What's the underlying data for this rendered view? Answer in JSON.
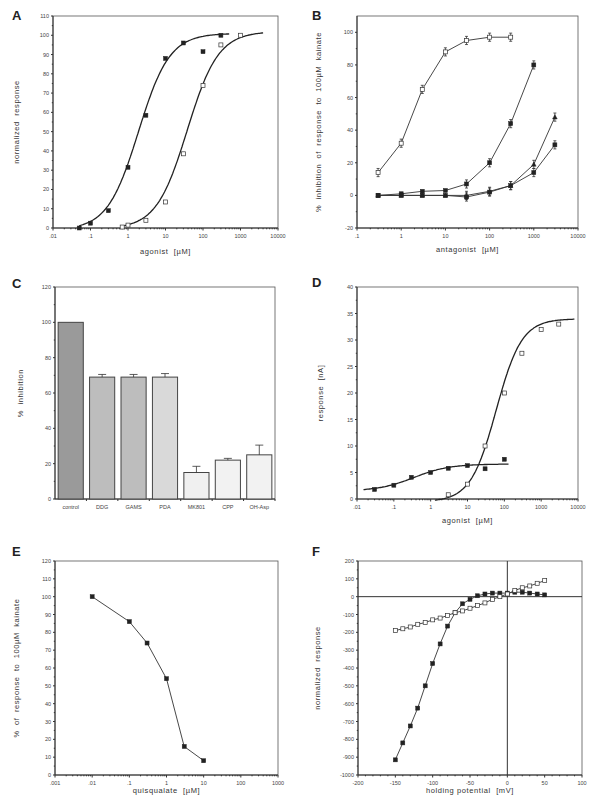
{
  "figure": {
    "panels": [
      "A",
      "B",
      "C",
      "D",
      "E",
      "F"
    ]
  },
  "chart_data": [
    {
      "panel": "A",
      "type": "line",
      "title": "",
      "xlabel": "agonist [µM]",
      "ylabel": "normalized response",
      "xscale": "log",
      "xlim": [
        0.01,
        10000
      ],
      "ylim": [
        0,
        110
      ],
      "xticks": [
        ".01",
        ".1",
        "1",
        "10",
        "100",
        "1000",
        "10000"
      ],
      "yticks": [
        "0",
        "10",
        "20",
        "30",
        "40",
        "50",
        "60",
        "70",
        "80",
        "90",
        "100",
        "110"
      ],
      "grid": false,
      "series": [
        {
          "name": "filled squares (fitted sigmoid)",
          "marker": "filled-square",
          "x": [
            0.05,
            0.1,
            0.3,
            1,
            3,
            10,
            30,
            100,
            300
          ],
          "y": [
            0,
            2.5,
            9,
            31.5,
            58.5,
            88,
            96,
            91.5,
            100
          ]
        },
        {
          "name": "open squares (fitted sigmoid)",
          "marker": "open-square",
          "x": [
            0.7,
            1,
            3,
            10,
            30,
            100,
            300,
            1000
          ],
          "y": [
            0.5,
            1.5,
            4,
            13.5,
            38.5,
            74,
            95,
            100
          ]
        }
      ]
    },
    {
      "panel": "B",
      "type": "line",
      "xlabel": "antagonist [µM]",
      "ylabel": "% inhibition of response to 100µM kainate",
      "xscale": "log",
      "xlim": [
        0.1,
        10000
      ],
      "ylim": [
        -20,
        110
      ],
      "xticks": [
        ".1",
        "1",
        "10",
        "100",
        "1000",
        "10000"
      ],
      "yticks": [
        "-20",
        "0",
        "20",
        "40",
        "60",
        "80",
        "100"
      ],
      "grid": false,
      "series": [
        {
          "name": "open squares",
          "marker": "open-square",
          "x": [
            0.3,
            1,
            3,
            10,
            30,
            100,
            300
          ],
          "y": [
            14,
            32,
            65,
            88,
            95,
            97,
            97
          ]
        },
        {
          "name": "filled squares (steep)",
          "marker": "filled-square",
          "x": [
            0.3,
            1,
            3,
            10,
            30,
            100,
            300,
            1000
          ],
          "y": [
            0,
            1,
            2.5,
            3,
            7,
            20,
            44,
            80
          ]
        },
        {
          "name": "triangles",
          "marker": "filled-triangle",
          "x": [
            0.3,
            1,
            3,
            10,
            30,
            100,
            300,
            1000,
            3000
          ],
          "y": [
            0,
            0,
            0,
            0,
            0,
            2.5,
            6,
            19,
            48
          ]
        },
        {
          "name": "filled squares (shallow)",
          "marker": "filled-square",
          "x": [
            0.3,
            1,
            3,
            10,
            30,
            100,
            300,
            1000,
            3000
          ],
          "y": [
            0,
            0,
            0,
            0,
            -1,
            2,
            6,
            14,
            31
          ]
        }
      ]
    },
    {
      "panel": "C",
      "type": "bar",
      "xlabel": "",
      "ylabel": "% inhibition",
      "ylim": [
        0,
        120
      ],
      "yticks": [
        "0",
        "20",
        "40",
        "60",
        "80",
        "100",
        "120"
      ],
      "categories": [
        "control",
        "DDG",
        "GAMS",
        "PDA",
        "MK801",
        "CPP",
        "OH-Asp"
      ],
      "values": [
        100,
        69,
        69,
        69,
        15,
        22,
        25
      ],
      "errors": [
        0,
        1.5,
        1.5,
        2,
        3.5,
        1,
        5.5
      ]
    },
    {
      "panel": "D",
      "type": "line",
      "xlabel": "agonist [µM]",
      "ylabel": "response [nA]",
      "xscale": "log",
      "xlim": [
        0.01,
        10000
      ],
      "ylim": [
        0,
        40
      ],
      "xticks": [
        ".01",
        ".1",
        "1",
        "10",
        "100",
        "1000",
        "10000"
      ],
      "yticks": [
        "0",
        "5",
        "10",
        "15",
        "20",
        "25",
        "30",
        "35",
        "40"
      ],
      "grid": false,
      "series": [
        {
          "name": "filled squares (low efficacy)",
          "marker": "filled-square",
          "x": [
            0.03,
            0.1,
            0.3,
            1,
            3,
            10,
            30,
            100
          ],
          "y": [
            1.8,
            2.6,
            4.1,
            5.0,
            5.8,
            6.3,
            5.7,
            7.5
          ]
        },
        {
          "name": "open squares (high efficacy)",
          "marker": "open-square",
          "x": [
            3,
            10,
            30,
            100,
            300,
            1000,
            3000
          ],
          "y": [
            0.8,
            2.8,
            10,
            20,
            27.5,
            32,
            33
          ]
        }
      ]
    },
    {
      "panel": "E",
      "type": "line",
      "xlabel": "quisqualate [µM]",
      "ylabel": "% of response to 100µM kainate",
      "xscale": "log",
      "xlim": [
        0.001,
        1000
      ],
      "ylim": [
        0,
        120
      ],
      "xticks": [
        ".001",
        ".01",
        ".1",
        "1",
        "10",
        "100",
        "1000"
      ],
      "yticks": [
        "0",
        "10",
        "20",
        "30",
        "40",
        "50",
        "60",
        "70",
        "80",
        "90",
        "100",
        "110",
        "120"
      ],
      "grid": false,
      "series": [
        {
          "name": "quisqualate",
          "marker": "filled-square",
          "x": [
            0.01,
            0.1,
            0.3,
            1,
            3,
            10
          ],
          "y": [
            100,
            86,
            74,
            54,
            16,
            8
          ]
        }
      ]
    },
    {
      "panel": "F",
      "type": "line",
      "xlabel": "holding potential [mV]",
      "ylabel": "normalized response",
      "xlim": [
        -200,
        100
      ],
      "ylim": [
        -1000,
        200
      ],
      "xticks": [
        "-200",
        "-150",
        "-100",
        "-50",
        "0",
        "50",
        "100"
      ],
      "yticks": [
        "-1000",
        "-900",
        "-800",
        "-700",
        "-600",
        "-500",
        "-400",
        "-300",
        "-200",
        "-100",
        "0",
        "100",
        "200"
      ],
      "grid": false,
      "annotations": "zero axes lines drawn at x=0 and y=0",
      "series": [
        {
          "name": "filled squares",
          "marker": "filled-square",
          "x": [
            -150,
            -140,
            -130,
            -120,
            -110,
            -100,
            -90,
            -80,
            -70,
            -60,
            -50,
            -40,
            -30,
            -20,
            -10,
            0,
            10,
            20,
            30,
            40,
            50
          ],
          "y": [
            -915,
            -820,
            -725,
            -625,
            -500,
            -375,
            -265,
            -165,
            -90,
            -40,
            -15,
            5,
            15,
            20,
            20,
            20,
            25,
            25,
            20,
            15,
            10
          ]
        },
        {
          "name": "open squares",
          "marker": "open-square",
          "x": [
            -150,
            -140,
            -130,
            -120,
            -110,
            -100,
            -90,
            -80,
            -70,
            -60,
            -50,
            -40,
            -30,
            -20,
            -10,
            0,
            10,
            20,
            30,
            40,
            50
          ],
          "y": [
            -190,
            -180,
            -170,
            -155,
            -145,
            -130,
            -120,
            -105,
            -90,
            -80,
            -65,
            -50,
            -35,
            -15,
            0,
            15,
            35,
            50,
            60,
            75,
            90
          ]
        }
      ]
    }
  ]
}
